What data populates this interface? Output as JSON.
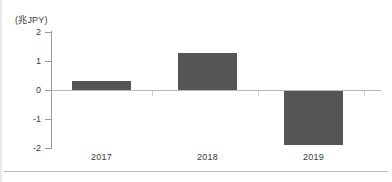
{
  "chart_data": {
    "type": "bar",
    "title": "",
    "subtitle": "",
    "xlabel": "",
    "ylabel": "(兆JPY)",
    "unit_label": "(兆JPY)",
    "categories": [
      "2017",
      "2018",
      "2019"
    ],
    "values": [
      0.3,
      1.28,
      -1.87
    ],
    "series": [
      {
        "name": "",
        "values": [
          0.3,
          1.28,
          -1.87
        ],
        "color": "#555555"
      }
    ],
    "ylim": [
      -2,
      2
    ],
    "yticks": [
      "2",
      "1",
      "0",
      "-1",
      "-2"
    ],
    "ytick_values": [
      2,
      1,
      0,
      -1,
      -2
    ],
    "grid": false,
    "legend": false,
    "legend_position": "none",
    "zero_line": true,
    "annotations": []
  },
  "axis": {
    "unit": "(兆JPY)",
    "tick_labels": [
      "2",
      "1",
      "0",
      "-1",
      "-2"
    ]
  },
  "colors": {
    "bar": "#555555",
    "axis": "#9a9a9a",
    "zero_line": "#b9b9b9",
    "text": "#3b3b3b",
    "rule": "#bcbcbc",
    "background": "#ffffff"
  }
}
